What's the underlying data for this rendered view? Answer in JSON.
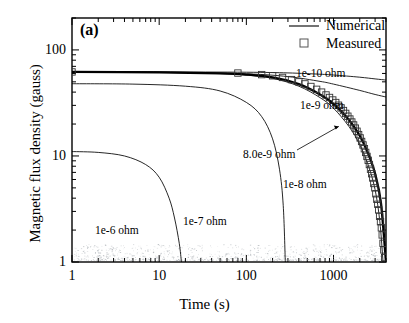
{
  "panel": {
    "label": "(a)"
  },
  "axes": {
    "xlabel": "Time (s)",
    "ylabel": "Magnetic flux density (gauss)",
    "xticks": [
      "1",
      "10",
      "100",
      "1000"
    ],
    "yticks": [
      "1",
      "10",
      "100"
    ]
  },
  "legend": {
    "items": [
      {
        "label": "Numerical",
        "marker": "line"
      },
      {
        "label": "Measured",
        "marker": "open-square"
      }
    ]
  },
  "curve_labels": [
    {
      "text": "1e-10 ohm"
    },
    {
      "text": "1e-9 ohm"
    },
    {
      "text": "8.0e-9 ohm"
    },
    {
      "text": "1e-8 ohm"
    },
    {
      "text": "1e-7 ohm"
    },
    {
      "text": "1e-6 ohm"
    }
  ],
  "chart_data": {
    "type": "line",
    "title": "(a)",
    "xlabel": "Time (s)",
    "ylabel": "Magnetic flux density (gauss)",
    "xscale": "log",
    "yscale": "log",
    "xlim": [
      1,
      4000
    ],
    "ylim": [
      1,
      200
    ],
    "xticks": [
      1,
      10,
      100,
      1000
    ],
    "yticks": [
      1,
      10,
      100
    ],
    "grid": false,
    "legend": [
      "Numerical",
      "Measured"
    ],
    "legend_position": "top-right",
    "annotations": [
      {
        "text": "1e-10 ohm",
        "x": 1500,
        "y": 62
      },
      {
        "text": "1e-9 ohm",
        "x": 1500,
        "y": 40
      },
      {
        "text": "8.0e-9 ohm",
        "x": 420,
        "y": 15,
        "leader_to": {
          "x": 1150,
          "y": 19
        }
      },
      {
        "text": "1e-8 ohm",
        "x": 900,
        "y": 7.2
      },
      {
        "text": "1e-7 ohm",
        "x": 110,
        "y": 2.6
      },
      {
        "text": "1e-6 ohm",
        "x": 7,
        "y": 2.6
      }
    ],
    "series": [
      {
        "name": "1e-10 ohm",
        "style": "thin-line",
        "x": [
          1,
          10,
          100,
          300,
          700,
          1000,
          2000,
          3000,
          4000
        ],
        "y": [
          62.0,
          62.0,
          61.6,
          60.7,
          59.0,
          58.0,
          55.3,
          53.3,
          52.0
        ]
      },
      {
        "name": "1e-9 ohm",
        "style": "thin-line",
        "x": [
          1,
          10,
          100,
          300,
          700,
          1000,
          2000,
          3000,
          4000
        ],
        "y": [
          62.0,
          61.8,
          59.5,
          56.0,
          50.5,
          47.6,
          41.5,
          38.0,
          36.0
        ]
      },
      {
        "name": "8.0e-9 ohm",
        "style": "thick-line",
        "x": [
          1,
          10,
          50,
          100,
          200,
          400,
          700,
          1000,
          1500,
          2000,
          2500,
          3000,
          3500,
          4000
        ],
        "y": [
          62.0,
          61.5,
          60.2,
          58.6,
          55.0,
          47.5,
          38.0,
          31.0,
          22.0,
          15.5,
          10.5,
          6.8,
          3.6,
          1.0
        ]
      },
      {
        "name": "1e-8 ohm",
        "style": "thin-line",
        "x": [
          1,
          10,
          50,
          100,
          200,
          400,
          700,
          1000,
          1500,
          2000,
          2500,
          3000,
          3400,
          3700
        ],
        "y": [
          62.0,
          61.4,
          59.8,
          57.9,
          54.0,
          45.5,
          35.5,
          28.2,
          19.0,
          12.8,
          8.2,
          4.8,
          2.4,
          1.0
        ]
      },
      {
        "name": "1e-7 ohm",
        "style": "thin-line",
        "x": [
          1,
          5,
          20,
          50,
          100,
          150,
          200,
          240,
          265,
          280
        ],
        "y": [
          48.0,
          47.6,
          45.5,
          41.0,
          32.0,
          23.5,
          14.5,
          7.5,
          3.4,
          1.0
        ]
      },
      {
        "name": "1e-6 ohm",
        "style": "thin-line",
        "x": [
          1,
          2,
          4,
          7,
          10,
          13,
          15,
          17,
          18
        ],
        "y": [
          11.0,
          10.8,
          10.0,
          8.3,
          6.3,
          4.0,
          2.6,
          1.5,
          1.0
        ]
      },
      {
        "name": "Measured",
        "style": "open-square-markers",
        "x": [
          1,
          80,
          150,
          200,
          260,
          330,
          400,
          470,
          550,
          640,
          730,
          820,
          900,
          980,
          1060,
          1140,
          1220,
          1300,
          1380,
          1460,
          1540,
          1620,
          1700,
          1780,
          1860,
          1940,
          2020,
          2100,
          2180,
          2260,
          2340,
          2420,
          2500,
          2580,
          2660,
          2740,
          2820,
          2900,
          2980,
          3060,
          3140,
          3220,
          3300,
          3380,
          3460,
          3540,
          3620,
          3700,
          3780,
          3860
        ],
        "y": [
          62.0,
          60.5,
          58.5,
          57.0,
          55.0,
          52.5,
          50.0,
          47.8,
          45.2,
          42.5,
          40.0,
          37.6,
          35.6,
          33.7,
          31.9,
          30.1,
          28.4,
          26.8,
          25.2,
          23.7,
          22.3,
          20.9,
          19.6,
          18.3,
          17.1,
          15.9,
          14.8,
          13.7,
          12.7,
          11.7,
          10.8,
          9.9,
          9.1,
          8.3,
          7.5,
          6.8,
          6.2,
          5.5,
          5.0,
          4.4,
          3.9,
          3.5,
          3.1,
          2.7,
          2.4,
          2.1,
          1.8,
          1.5,
          1.3,
          1.1
        ]
      }
    ]
  }
}
